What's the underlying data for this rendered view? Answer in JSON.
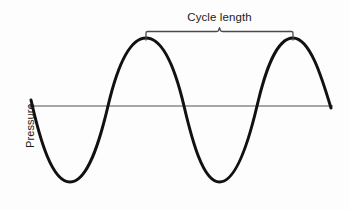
{
  "figure": {
    "background_color": "#fdfdfd",
    "width": 349,
    "height": 210
  },
  "axis": {
    "y_label": "Pressure",
    "baseline_color": "#8a8a8a",
    "baseline_y": 106,
    "baseline_x_start": 28,
    "baseline_x_end": 333
  },
  "annotation": {
    "label": "Cycle length",
    "bracket_color": "#4a4a4a",
    "bracket_left_x": 146,
    "bracket_right_x": 293,
    "bracket_y": 32,
    "bracket_mid_x": 219.5
  },
  "chart_data": {
    "type": "line",
    "title": "",
    "xlabel": "",
    "ylabel": "Pressure",
    "grid": false,
    "legend": null,
    "xlim": [
      31,
      331
    ],
    "ylim": [
      38,
      182
    ],
    "annotations": [
      {
        "text": "Cycle length",
        "kind": "span-bracket",
        "x_start": 146,
        "x_end": 293,
        "meaning": "one full wave period measured peak-to-peak"
      }
    ],
    "series": [
      {
        "name": "Pressure waveform",
        "color": "#111111",
        "line_width": 3,
        "waveform": "sine",
        "cycles": 2,
        "amplitude_px": 68,
        "period_px": 147,
        "baseline_y_px": 106,
        "key_points": [
          {
            "label": "start",
            "x": 31,
            "y": 100
          },
          {
            "label": "zero-crossing-down",
            "x": 33,
            "y": 106
          },
          {
            "label": "trough-1",
            "x": 70,
            "y": 182
          },
          {
            "label": "zero-crossing-up",
            "x": 108,
            "y": 106
          },
          {
            "label": "peak-1",
            "x": 146,
            "y": 38
          },
          {
            "label": "zero-crossing-down",
            "x": 184,
            "y": 106
          },
          {
            "label": "trough-2",
            "x": 219,
            "y": 182
          },
          {
            "label": "zero-crossing-up",
            "x": 257,
            "y": 106
          },
          {
            "label": "peak-2",
            "x": 293,
            "y": 38
          },
          {
            "label": "end",
            "x": 331,
            "y": 108
          }
        ],
        "path": "M 31,100 C 40,140 52,182 70,182 C 88,182 100,140 108,106 C 116,72 128,38 146,38 C 164,38 176,72 184,106 C 192,140 203,182 219.5,182 C 236,182 249,140 257,106 C 265,72 276,38 293,38 C 310,38 322,78 331,108"
      }
    ]
  }
}
